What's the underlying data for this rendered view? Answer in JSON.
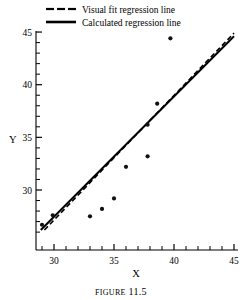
{
  "figure": {
    "caption_prefix": "Figure",
    "caption_number": "11.5",
    "caption_full": "Figure 11.5"
  },
  "legend": {
    "position": "top",
    "entries": [
      {
        "label": "Visual fit regression line",
        "style": "dashed",
        "color": "#000000",
        "sample_name": "dashed-line-sample"
      },
      {
        "label": "Calculated regression line",
        "style": "solid",
        "color": "#000000",
        "sample_name": "solid-line-sample"
      }
    ]
  },
  "chart_data": {
    "type": "scatter",
    "title": "",
    "xlabel": "X",
    "ylabel": "Y",
    "xlim": [
      28.5,
      45
    ],
    "ylim": [
      26.0,
      45
    ],
    "grid": false,
    "legend_position": "top",
    "marker_color": "#111111",
    "axis_color": "#000000",
    "x_ticks_major": [
      30,
      35,
      40,
      45
    ],
    "x_tick_labels": [
      "30",
      "35",
      "40",
      "45"
    ],
    "y_ticks_major": [
      30,
      35,
      40,
      45
    ],
    "y_tick_labels": [
      "30",
      "35",
      "40",
      "45"
    ],
    "x_minor_tick_step": 1,
    "y_minor_tick_step": 1,
    "points": [
      {
        "x": 29.0,
        "y": 26.7
      },
      {
        "x": 29.9,
        "y": 27.6
      },
      {
        "x": 33.0,
        "y": 27.5
      },
      {
        "x": 34.0,
        "y": 28.2
      },
      {
        "x": 35.0,
        "y": 29.2
      },
      {
        "x": 36.0,
        "y": 32.2
      },
      {
        "x": 37.8,
        "y": 33.2
      },
      {
        "x": 37.8,
        "y": 36.2
      },
      {
        "x": 38.6,
        "y": 38.2
      },
      {
        "x": 39.7,
        "y": 44.4
      }
    ],
    "series": [
      {
        "name": "Visual fit regression line",
        "type": "line",
        "style": "dashed",
        "color": "#000000",
        "x": [
          29.2,
          45.0
        ],
        "y": [
          26.2,
          44.9
        ]
      },
      {
        "name": "Calculated regression line",
        "type": "line",
        "style": "solid",
        "color": "#000000",
        "x": [
          28.9,
          45.0
        ],
        "y": [
          26.2,
          44.6
        ]
      }
    ]
  }
}
